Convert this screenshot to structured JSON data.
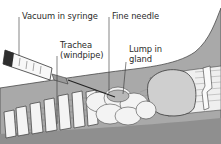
{
  "diagram": {
    "type": "medical-illustration",
    "labels": {
      "vacuum": "Vacuum in syringe",
      "needle": "Fine needle",
      "trachea_line1": "Trachea",
      "trachea_line2": "(windpipe)",
      "lump_line1": "Lump in",
      "lump_line2": "gland"
    },
    "colors": {
      "background": "#ffffff",
      "tissue": "#a9a9a9",
      "tissue_dark": "#8f8f8f",
      "gland": "#ececec",
      "cartilage": "#f2f2f2",
      "outline": "#3a3a3a",
      "text": "#2a2a2a"
    }
  }
}
